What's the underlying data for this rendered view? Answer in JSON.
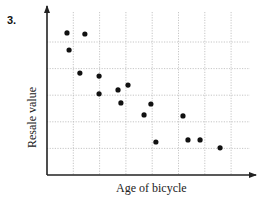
{
  "question": {
    "number": "3."
  },
  "chart_data": {
    "type": "scatter",
    "title": "",
    "xlabel": "Age of bicycle",
    "ylabel": "Resale value",
    "xlim": [
      0,
      8
    ],
    "ylim": [
      0,
      6.4
    ],
    "grid": true,
    "grid_style": "dotted",
    "tick_labels": false,
    "legend": null,
    "x_gridlines": [
      1,
      2,
      3,
      4,
      5,
      6,
      7
    ],
    "y_gridlines": [
      1,
      2,
      3,
      4,
      5
    ],
    "points": [
      {
        "x": 0.76,
        "y": 5.34
      },
      {
        "x": 1.44,
        "y": 5.3
      },
      {
        "x": 0.84,
        "y": 4.7
      },
      {
        "x": 1.25,
        "y": 3.83
      },
      {
        "x": 1.98,
        "y": 3.72
      },
      {
        "x": 1.98,
        "y": 3.05
      },
      {
        "x": 2.7,
        "y": 3.2
      },
      {
        "x": 3.08,
        "y": 3.38
      },
      {
        "x": 2.81,
        "y": 2.71
      },
      {
        "x": 3.95,
        "y": 2.67
      },
      {
        "x": 3.69,
        "y": 2.26
      },
      {
        "x": 4.14,
        "y": 1.24
      },
      {
        "x": 5.17,
        "y": 2.22
      },
      {
        "x": 5.36,
        "y": 1.32
      },
      {
        "x": 5.82,
        "y": 1.32
      },
      {
        "x": 6.58,
        "y": 1.02
      }
    ],
    "colors": {
      "point": "#111111",
      "axis": "#222222",
      "grid": "#b8b8b8"
    }
  },
  "layout": {
    "origin_px": [
      47,
      175
    ],
    "unit_px": [
      26.3,
      26.6
    ],
    "x_axis_end_px": 256,
    "y_axis_top_px": 6
  }
}
